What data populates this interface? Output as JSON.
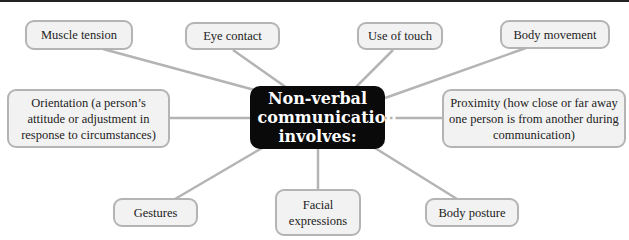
{
  "diagram": {
    "center": {
      "label": "Non-verbal communication involves:"
    },
    "nodes": [
      {
        "id": "muscle-tension",
        "label": "Muscle tension"
      },
      {
        "id": "eye-contact",
        "label": "Eye contact"
      },
      {
        "id": "use-of-touch",
        "label": "Use of touch"
      },
      {
        "id": "body-movement",
        "label": "Body movement"
      },
      {
        "id": "orientation",
        "label": "Orientation (a person’s attitude or adjustment in response to circumstances)"
      },
      {
        "id": "proximity",
        "label": "Proximity (how close or far away one person is from another during communication)"
      },
      {
        "id": "gestures",
        "label": "Gestures"
      },
      {
        "id": "facial-expressions",
        "label": "Facial expressions"
      },
      {
        "id": "body-posture",
        "label": "Body posture"
      }
    ],
    "colors": {
      "center_bg": "#0a0a0a",
      "node_bg": "#f2f2f2",
      "node_border": "#b4b4b4",
      "connector": "#b4b4b4"
    }
  }
}
